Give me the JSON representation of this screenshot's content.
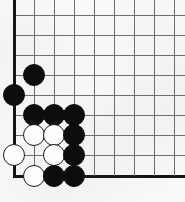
{
  "figure": {
    "kind": "go-board-diagram",
    "board": {
      "width_px": 185,
      "height_px": 202,
      "origin_x": 14,
      "origin_y": 15,
      "spacing": 20,
      "columns": 9,
      "rows": 9,
      "left_edge_is_board_edge": true,
      "bottom_edge_is_board_edge": true,
      "line_color": "#6e6e70",
      "edge_color": "#151515",
      "background_color": "#fbfbfa"
    },
    "stone_style": {
      "radius_px": 11,
      "black_color": "#0d0d0d",
      "white_fill": "#fdfdfc",
      "white_outline": "#1a1a1a"
    },
    "stones": [
      {
        "color": "black",
        "col": 1,
        "row": 3,
        "x": 34,
        "y": 75
      },
      {
        "color": "black",
        "col": 0,
        "row": 4,
        "x": 14,
        "y": 95
      },
      {
        "color": "black",
        "col": 1,
        "row": 5,
        "x": 34,
        "y": 115
      },
      {
        "color": "black",
        "col": 2,
        "row": 5,
        "x": 54,
        "y": 115
      },
      {
        "color": "black",
        "col": 3,
        "row": 5,
        "x": 74,
        "y": 115
      },
      {
        "color": "white",
        "col": 1,
        "row": 6,
        "x": 34,
        "y": 135
      },
      {
        "color": "white",
        "col": 2,
        "row": 6,
        "x": 54,
        "y": 135
      },
      {
        "color": "black",
        "col": 3,
        "row": 6,
        "x": 74,
        "y": 135
      },
      {
        "color": "white",
        "col": 0,
        "row": 7,
        "x": 14,
        "y": 155
      },
      {
        "color": "white",
        "col": 2,
        "row": 7,
        "x": 54,
        "y": 155
      },
      {
        "color": "black",
        "col": 3,
        "row": 7,
        "x": 74,
        "y": 155
      },
      {
        "color": "white",
        "col": 1,
        "row": 8,
        "x": 34,
        "y": 176
      },
      {
        "color": "black",
        "col": 2,
        "row": 8,
        "x": 54,
        "y": 176
      },
      {
        "color": "black",
        "col": 3,
        "row": 8,
        "x": 74,
        "y": 176
      }
    ],
    "grid_lines": {
      "horizontal": [
        {
          "y": 15,
          "edge": false
        },
        {
          "y": 35,
          "edge": false
        },
        {
          "y": 55,
          "edge": false
        },
        {
          "y": 75,
          "edge": false
        },
        {
          "y": 95,
          "edge": false
        },
        {
          "y": 115,
          "edge": false
        },
        {
          "y": 135,
          "edge": false
        },
        {
          "y": 155,
          "edge": false
        },
        {
          "y": 176,
          "edge": true
        }
      ],
      "vertical": [
        {
          "x": 14,
          "edge": true
        },
        {
          "x": 34,
          "edge": false
        },
        {
          "x": 54,
          "edge": false
        },
        {
          "x": 74,
          "edge": false
        },
        {
          "x": 94,
          "edge": false
        },
        {
          "x": 114,
          "edge": false
        },
        {
          "x": 134,
          "edge": false
        },
        {
          "x": 154,
          "edge": false
        },
        {
          "x": 174,
          "edge": false
        }
      ]
    }
  }
}
